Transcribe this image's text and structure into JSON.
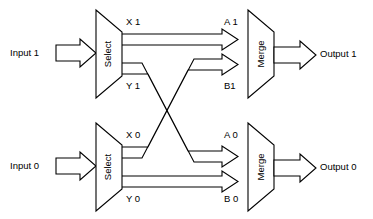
{
  "diagram": {
    "type": "block-diagram",
    "background_color": "#ffffff",
    "line_color": "#000000",
    "fill_color": "#ffffff"
  },
  "blocks": {
    "select_top": {
      "label": "Select",
      "orientation": "vertical"
    },
    "select_bottom": {
      "label": "Select",
      "orientation": "vertical"
    },
    "merge_top": {
      "label": "Merge",
      "orientation": "vertical"
    },
    "merge_bottom": {
      "label": "Merge",
      "orientation": "vertical"
    }
  },
  "inputs": [
    {
      "label": "Input 1",
      "channel": "1"
    },
    {
      "label": "Input 0",
      "channel": "0"
    }
  ],
  "outputs": [
    {
      "label": "Output 1",
      "channel": "1"
    },
    {
      "label": "Output 0",
      "channel": "0"
    }
  ],
  "ports": {
    "select_top": [
      {
        "label": "X 1",
        "name": "x1"
      },
      {
        "label": "Y 1",
        "name": "y1"
      }
    ],
    "select_bottom": [
      {
        "label": "X 0",
        "name": "x0"
      },
      {
        "label": "Y 0",
        "name": "y0"
      }
    ],
    "merge_top": [
      {
        "label": "A 1",
        "name": "a1"
      },
      {
        "label": "B1",
        "name": "b1"
      }
    ],
    "merge_bottom": [
      {
        "label": "A 0",
        "name": "a0"
      },
      {
        "label": "B 0",
        "name": "b0"
      }
    ]
  },
  "connections": [
    {
      "from": "x1",
      "to": "a1",
      "crosses": false
    },
    {
      "from": "y1",
      "to": "b0",
      "crosses": true
    },
    {
      "from": "x0",
      "to": "b1",
      "crosses": true
    },
    {
      "from": "y0",
      "to": "a0",
      "crosses": false
    }
  ]
}
